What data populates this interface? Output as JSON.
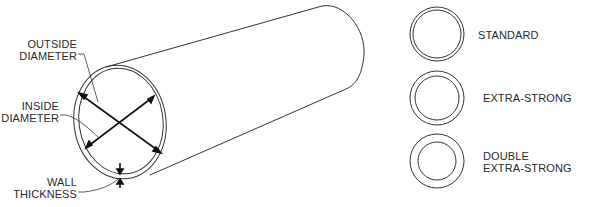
{
  "diagram": {
    "type": "pipe-cross-section",
    "labels": {
      "outside_diameter_line1": "OUTSIDE",
      "outside_diameter_line2": "DIAMETER",
      "inside_diameter_line1": "INSIDE",
      "inside_diameter_line2": "DIAMETER",
      "wall_thickness_line1": "WALL",
      "wall_thickness_line2": "THICKNESS"
    },
    "schedules": [
      {
        "label_line1": "STANDARD",
        "label_line2": ""
      },
      {
        "label_line1": "EXTRA-STRONG",
        "label_line2": ""
      },
      {
        "label_line1": "DOUBLE",
        "label_line2": "EXTRA-STRONG"
      }
    ],
    "colors": {
      "stroke": "#333333",
      "text": "#2a2a2a",
      "background": "#ffffff"
    }
  }
}
